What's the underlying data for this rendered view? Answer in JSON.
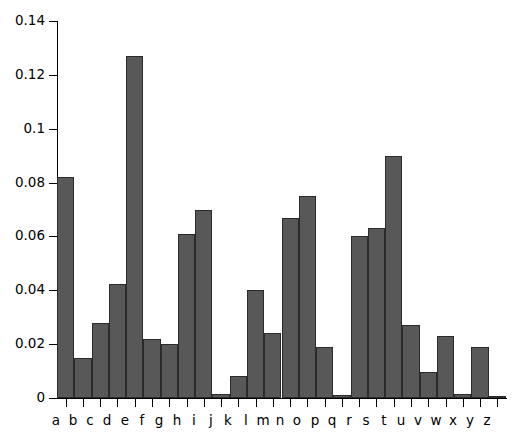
{
  "chart_data": {
    "type": "bar",
    "title": "",
    "subtitle": "",
    "xlabel": "",
    "ylabel": "",
    "categories": [
      "a",
      "b",
      "c",
      "d",
      "e",
      "f",
      "g",
      "h",
      "i",
      "j",
      "k",
      "l",
      "m",
      "n",
      "o",
      "p",
      "q",
      "r",
      "s",
      "t",
      "u",
      "v",
      "w",
      "x",
      "y",
      "z"
    ],
    "values": [
      0.082,
      0.015,
      0.028,
      0.0425,
      0.127,
      0.022,
      0.02,
      0.061,
      0.07,
      0.0015,
      0.008,
      0.04,
      0.024,
      0.067,
      0.075,
      0.019,
      0.001,
      0.06,
      0.063,
      0.09,
      0.027,
      0.0095,
      0.023,
      0.0015,
      0.019,
      0.0007
    ],
    "ylim": [
      0,
      0.14
    ],
    "xlim": [
      0,
      26
    ],
    "y_ticks": [
      0,
      0.02,
      0.04,
      0.06,
      0.08,
      0.1,
      0.12,
      0.14
    ],
    "y_tick_labels": [
      "0",
      "0.02",
      "0.04",
      "0.06",
      "0.08",
      "0.1",
      "0.12",
      "0.14"
    ],
    "x_tick_labels": [
      "a",
      "b",
      "c",
      "d",
      "e",
      "f",
      "g",
      "h",
      "i",
      "j",
      "k",
      "l",
      "m",
      "n",
      "o",
      "p",
      "q",
      "r",
      "s",
      "t",
      "u",
      "v",
      "w",
      "x",
      "y",
      "z"
    ],
    "grid": false,
    "legend": null,
    "legend_position": "none",
    "annotations": [],
    "bar_fill_color": "#585858",
    "bar_edge_color": "#2b2b2b",
    "axis_color": "#000000",
    "background_color": "#ffffff",
    "bar_gap": 0,
    "series": [
      {
        "name": "letter frequency",
        "values": [
          0.082,
          0.015,
          0.028,
          0.0425,
          0.127,
          0.022,
          0.02,
          0.061,
          0.07,
          0.0015,
          0.008,
          0.04,
          0.024,
          0.067,
          0.075,
          0.019,
          0.001,
          0.06,
          0.063,
          0.09,
          0.027,
          0.0095,
          0.023,
          0.0015,
          0.019,
          0.0007
        ]
      }
    ]
  }
}
